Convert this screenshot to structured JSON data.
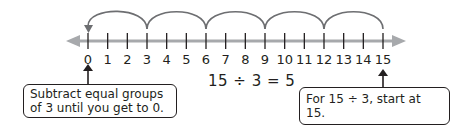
{
  "number_line": {
    "min": 0,
    "max": 15,
    "ticks": [
      "0",
      "1",
      "2",
      "3",
      "4",
      "5",
      "6",
      "7",
      "8",
      "9",
      "10",
      "11",
      "12",
      "13",
      "14",
      "15"
    ],
    "line_color": "#a7a9ac",
    "tick_color": "#231f20"
  },
  "jumps": {
    "start": 15,
    "end": 0,
    "step": 3,
    "points": [
      15,
      12,
      9,
      6,
      3,
      0
    ],
    "arc_color": "#6d6e71"
  },
  "equation": "15 ÷ 3 = 5",
  "callouts": {
    "left": {
      "line1": "Subtract equal groups",
      "line2": "of 3 until you get to 0.",
      "points_to": 0
    },
    "right": {
      "text": "For 15 ÷ 3, start at 15.",
      "points_to": 15
    }
  }
}
